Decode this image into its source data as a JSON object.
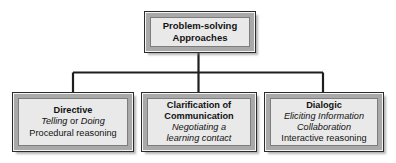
{
  "diagram": {
    "type": "hierarchy-tree",
    "title": "Problem-solving Approaches",
    "root": {
      "name": "root-node",
      "lines": [
        {
          "text": "Problem-solving",
          "style": "bold"
        },
        {
          "text": "Approaches",
          "style": "bold"
        }
      ]
    },
    "children": [
      {
        "name": "directive-node",
        "heading": "Directive",
        "lines": [
          {
            "text": "Directive",
            "style": "bold"
          },
          {
            "style": "mixed",
            "segments": [
              {
                "text": "Telling",
                "style": "italic"
              },
              {
                "text": " or ",
                "style": "plain"
              },
              {
                "text": "Doing",
                "style": "italic"
              }
            ]
          },
          {
            "text": "Procedural reasoning",
            "style": "plain"
          }
        ]
      },
      {
        "name": "clarification-node",
        "heading": "Clarification of Communication",
        "lines": [
          {
            "text": "Clarification of",
            "style": "bold"
          },
          {
            "text": "Communication",
            "style": "bold"
          },
          {
            "text": "Negotiating a",
            "style": "italic"
          },
          {
            "text": "learning contact",
            "style": "italic"
          }
        ]
      },
      {
        "name": "dialogic-node",
        "heading": "Dialogic",
        "lines": [
          {
            "text": "Dialogic",
            "style": "bold"
          },
          {
            "text": "Eliciting Information",
            "style": "italic"
          },
          {
            "text": "Collaboration",
            "style": "italic"
          },
          {
            "text": "Interactive reasoning",
            "style": "plain"
          }
        ]
      }
    ],
    "colors": {
      "box_fill": "#e9e9e9",
      "box_bevel": "#a9a9a9",
      "box_outline": "#2b2b2b",
      "connector": "#1e1e1e",
      "text": "#121212",
      "background": "#ffffff"
    }
  }
}
